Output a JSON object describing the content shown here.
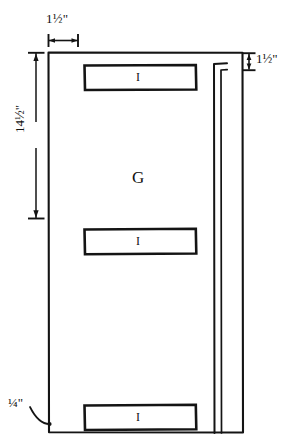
{
  "drawing": {
    "title": "Door panel and rail layout sketch",
    "style": "hand-drawn technical sketch",
    "background_color": "#ffffff",
    "ink_color": "#111111",
    "units": "inches"
  },
  "dimensions": {
    "top_width": "1½\"",
    "right_height": "1½\"",
    "left_height": "14½\"",
    "thickness": "¼\""
  },
  "parts": {
    "panel_label": "G",
    "rail_labels": [
      "I",
      "I",
      "I"
    ]
  },
  "geometry": {
    "outer_rect": {
      "x": 48,
      "y": 52,
      "width": 195,
      "height": 381
    },
    "rails": [
      {
        "x": 84,
        "y": 65,
        "width": 112,
        "height": 25
      },
      {
        "x": 84,
        "y": 229,
        "width": 112,
        "height": 25
      },
      {
        "x": 84,
        "y": 405,
        "width": 112,
        "height": 25
      }
    ],
    "stile_channel": {
      "x": 213,
      "y": 62,
      "width": 14,
      "height": 371
    }
  },
  "annotations": {
    "top_dimension_line": {
      "x1": 48,
      "x2": 78,
      "y": 40
    },
    "left_dimension_line": {
      "x": 36,
      "y1": 52,
      "y2": 218
    },
    "right_dimension_line": {
      "x": 249,
      "y1": 53,
      "y2": 70
    },
    "thickness_leader": {
      "from": [
        30,
        408
      ],
      "to": [
        50,
        424
      ]
    }
  }
}
